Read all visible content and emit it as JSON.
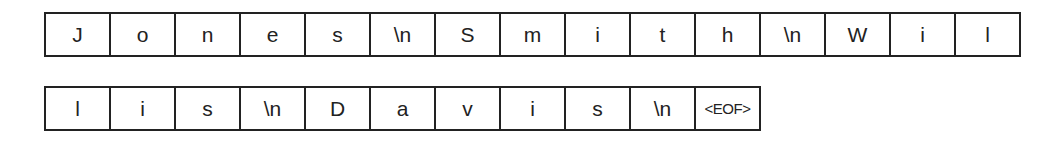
{
  "rows": [
    {
      "cells": [
        "J",
        "o",
        "n",
        "e",
        "s",
        "\\n",
        "S",
        "m",
        "i",
        "t",
        "h",
        "\\n",
        "W",
        "i",
        "l"
      ]
    },
    {
      "cells": [
        "l",
        "i",
        "s",
        "\\n",
        "D",
        "a",
        "v",
        "i",
        "s",
        "\\n",
        "<EOF>"
      ]
    }
  ]
}
